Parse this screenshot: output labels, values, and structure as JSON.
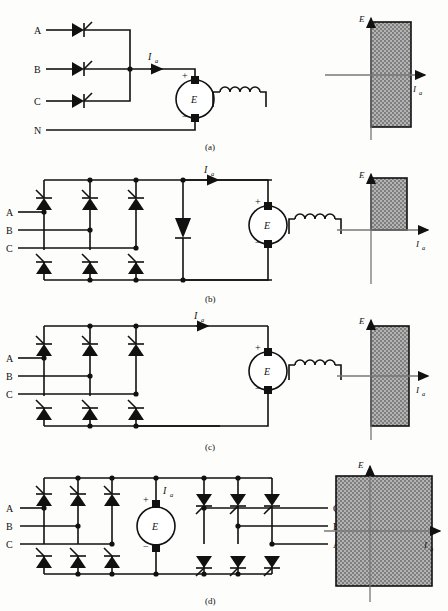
{
  "figure": {
    "axis_labels": {
      "voltage": "E",
      "current": "I",
      "current_sub": "a"
    },
    "source_label": "E",
    "plus": "+",
    "minus": "−"
  },
  "subfigures": [
    {
      "caption": "(a)",
      "topology": "three-phase half-wave thyristor rectifier",
      "phase_labels": [
        "A",
        "B",
        "C"
      ],
      "neutral_label": "N",
      "current_label": "I",
      "current_sub": "a",
      "quadrants": [
        1,
        4
      ],
      "chart": {
        "type": "region",
        "xlabel": "I",
        "xlabel_sub": "a",
        "ylabel": "E",
        "region": {
          "x0": 0,
          "x1": 1,
          "y0": -1,
          "y1": 1
        },
        "fill": "#9a9a9a"
      }
    },
    {
      "caption": "(b)",
      "topology": "three-phase full bridge with freewheeling diode",
      "phase_labels": [
        "A",
        "B",
        "C"
      ],
      "current_label": "I",
      "current_sub": "a",
      "quadrants": [
        1
      ],
      "chart": {
        "type": "region",
        "xlabel": "I",
        "xlabel_sub": "a",
        "ylabel": "E",
        "region": {
          "x0": 0,
          "x1": 1,
          "y0": 0,
          "y1": 1
        },
        "fill": "#9a9a9a"
      }
    },
    {
      "caption": "(c)",
      "topology": "three-phase full thyristor bridge",
      "phase_labels": [
        "A",
        "B",
        "C"
      ],
      "current_label": "I",
      "current_sub": "a",
      "quadrants": [
        1,
        4
      ],
      "chart": {
        "type": "region",
        "xlabel": "I",
        "xlabel_sub": "a",
        "ylabel": "E",
        "region": {
          "x0": 0,
          "x1": 1,
          "y0": -1,
          "y1": 1
        },
        "fill": "#9a9a9a"
      }
    },
    {
      "caption": "(d)",
      "topology": "dual converter, two anti-parallel bridges",
      "phase_labels_left": [
        "A",
        "B",
        "C"
      ],
      "phase_labels_right": [
        "C",
        "B",
        "A"
      ],
      "current_label": "I",
      "current_sub": "a",
      "quadrants": [
        1,
        2,
        3,
        4
      ],
      "chart": {
        "type": "region",
        "xlabel": "I",
        "xlabel_sub": "a",
        "ylabel": "E",
        "region": {
          "x0": -1,
          "x1": 1,
          "y0": -1,
          "y1": 1
        },
        "fill": "#9a9a9a"
      }
    }
  ]
}
